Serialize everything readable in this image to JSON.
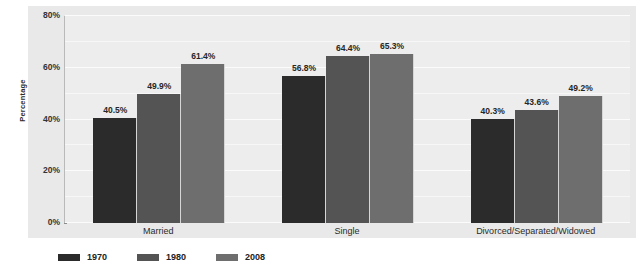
{
  "chart_data": {
    "type": "bar",
    "title": "",
    "subtitle": "",
    "xlabel": "",
    "ylabel": "Percentage",
    "ylim": [
      0,
      80
    ],
    "y_ticks": [
      "0%",
      "20%",
      "40%",
      "60%",
      "80%"
    ],
    "y_tick_values": [
      0,
      20,
      40,
      60,
      80
    ],
    "gridlines": [
      0,
      10,
      20,
      30,
      40,
      50,
      60,
      70,
      80
    ],
    "grid": true,
    "legend_position": "bottom-left",
    "categories": [
      "Married",
      "Single",
      "Divorced/Separated/Widowed"
    ],
    "series": [
      {
        "name": "1970",
        "color": "#2b2b2b",
        "values": [
          40.5,
          56.8,
          40.3
        ],
        "labels": [
          "40.5%",
          "49.9%",
          "40.3%"
        ]
      },
      {
        "name": "1980",
        "color": "#545454",
        "values": [
          49.9,
          64.4,
          43.6
        ],
        "labels": [
          "49.9%",
          "64.4%",
          "43.6%"
        ]
      },
      {
        "name": "2008",
        "color": "#6e6e6e",
        "values": [
          61.4,
          65.3,
          49.2
        ],
        "labels": [
          "61.4%",
          "65.3%",
          "49.2%"
        ]
      }
    ],
    "bar_labels": [
      [
        "40.5%",
        "49.9%",
        "61.4%"
      ],
      [
        "56.8%",
        "64.4%",
        "65.3%"
      ],
      [
        "40.3%",
        "43.6%",
        "49.2%"
      ]
    ],
    "bar_values": [
      [
        40.5,
        49.9,
        61.4
      ],
      [
        56.8,
        64.4,
        65.3
      ],
      [
        40.3,
        43.6,
        49.2
      ]
    ]
  },
  "legend": {
    "items": [
      {
        "label": "1970",
        "color": "#2b2b2b"
      },
      {
        "label": "1980",
        "color": "#545454"
      },
      {
        "label": "2008",
        "color": "#6e6e6e"
      }
    ]
  },
  "colors": {
    "panel_background": "#e9e9e9",
    "plot_background": "#ededed",
    "gridline": "#f8f8f8",
    "axis": "#b9b9b9",
    "text": "#2b2b2b",
    "series_1970": "#2b2b2b",
    "series_1980": "#545454",
    "series_2008": "#6e6e6e"
  }
}
